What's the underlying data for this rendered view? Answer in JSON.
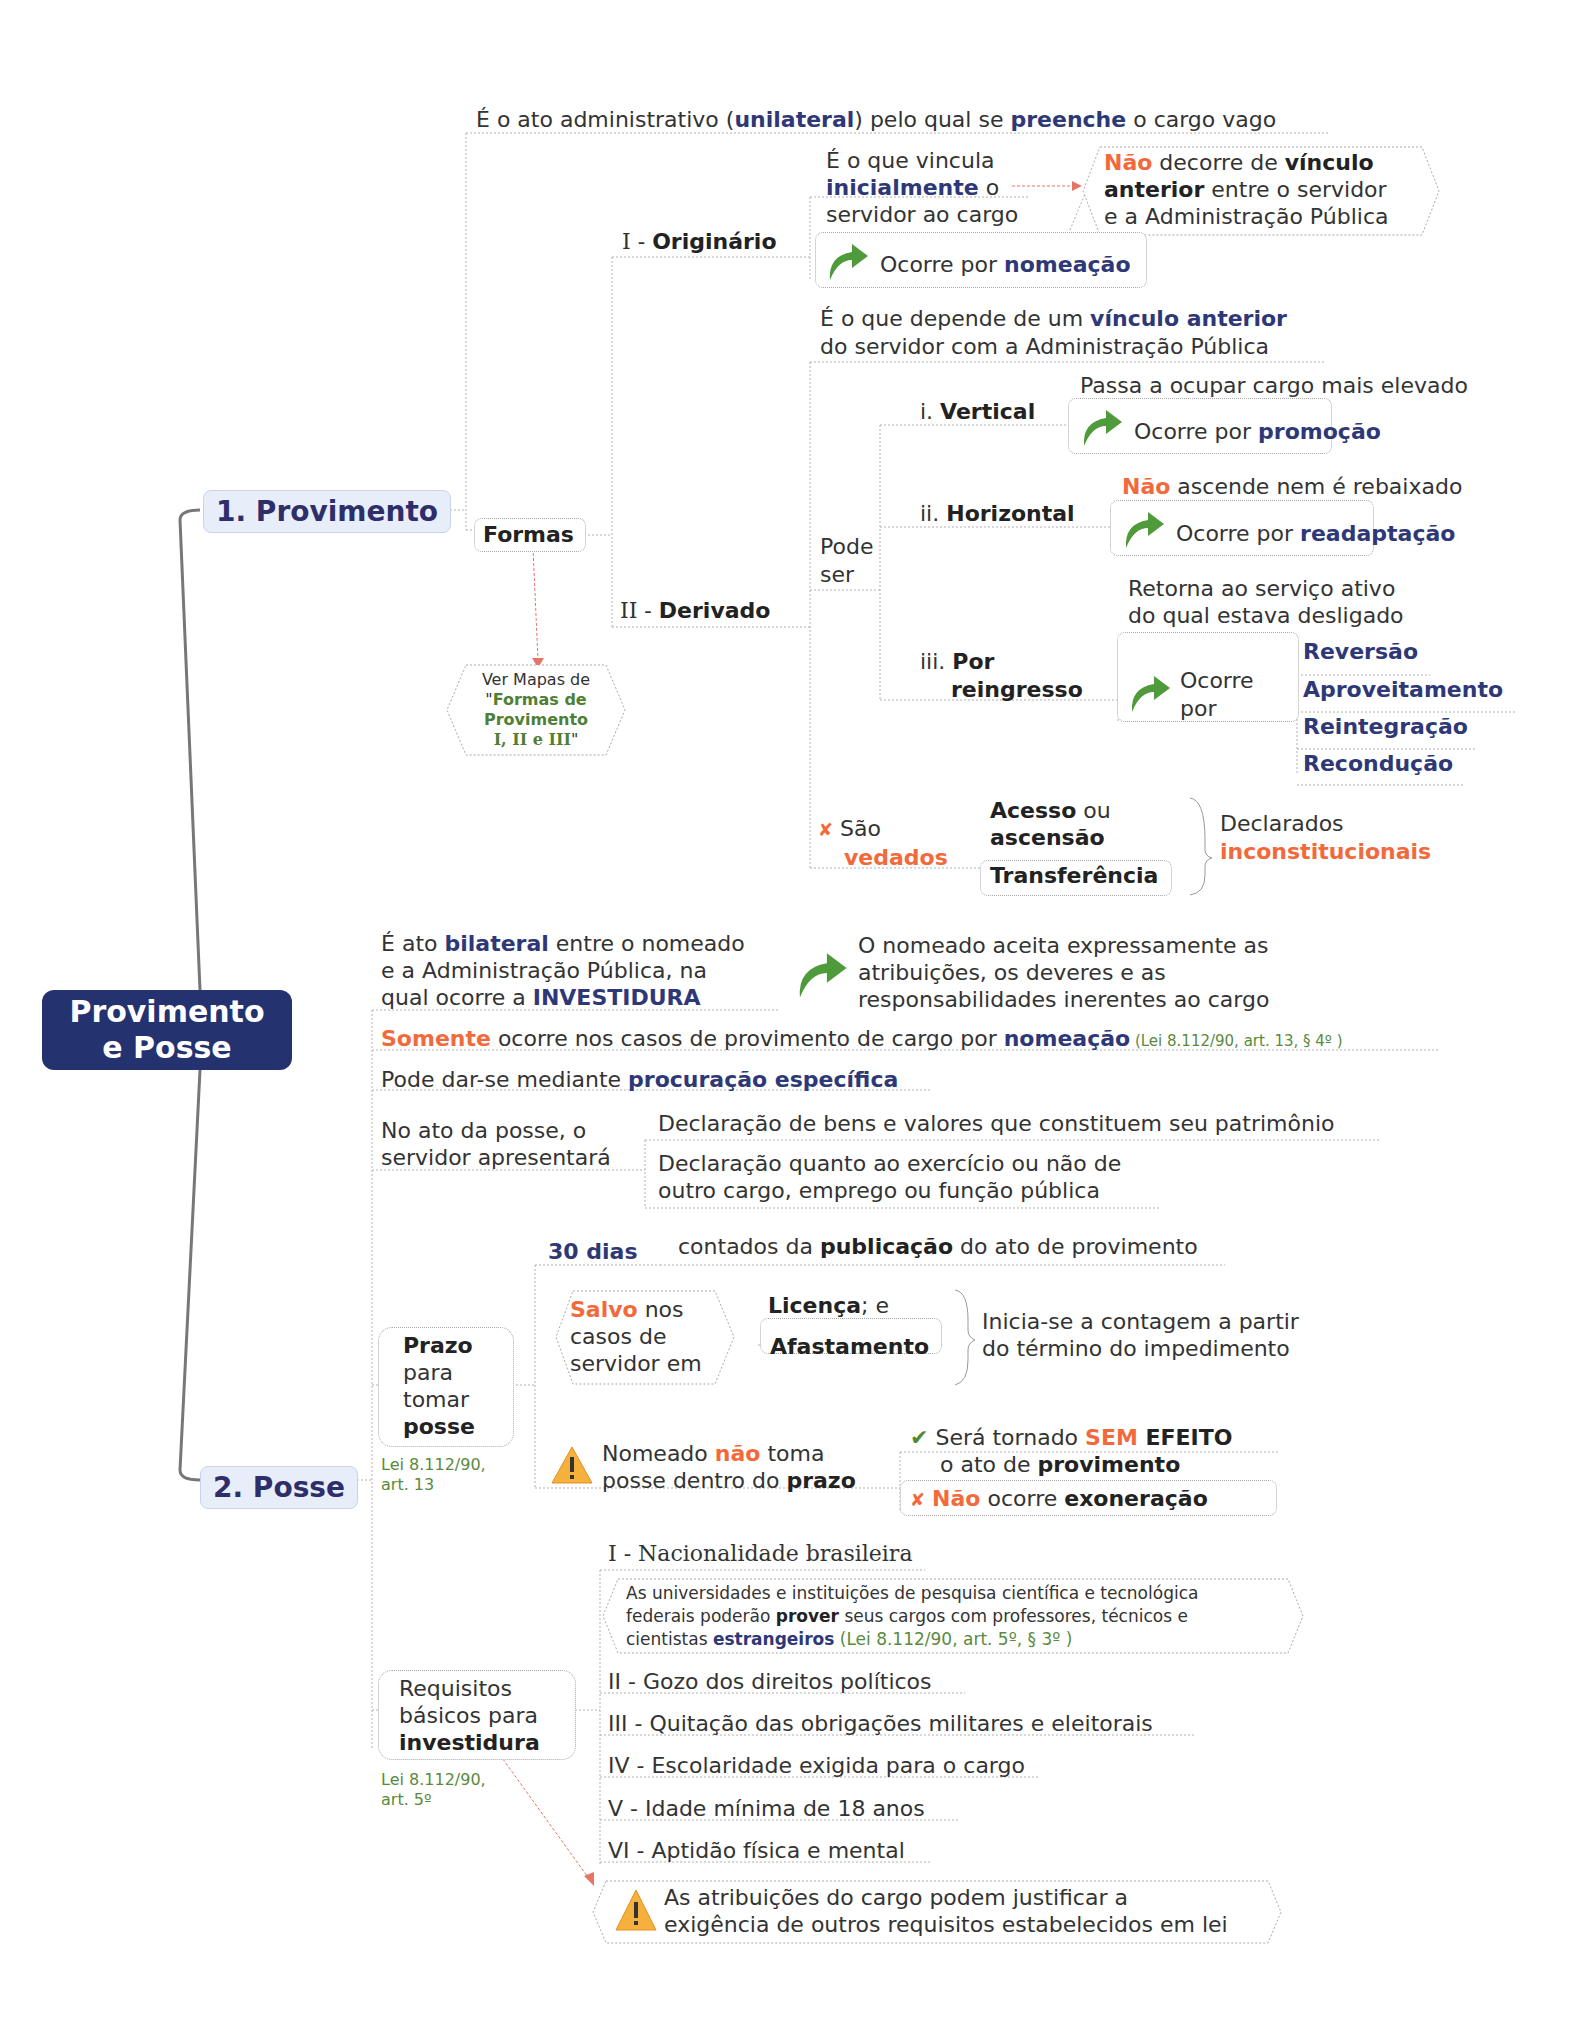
{
  "root": {
    "line1": "Provimento",
    "line2": "e Posse"
  },
  "colors": {
    "root_bg": "#253270",
    "accent_blue": "#2e3877",
    "accent_orange": "#f26a3c",
    "ref_green": "#5a8a3e",
    "main_node_bg": "#e8eef9"
  },
  "provimento": {
    "label": "1. Provimento",
    "definition": {
      "p1": "É o ato administrativo (",
      "k1": "unilateral",
      "p2": ") pelo qual se ",
      "k2": "preenche",
      "p3": " o cargo vago"
    },
    "formas_label": "Formas",
    "see_maps": {
      "l1": "Ver Mapas de",
      "q1": "\"",
      "l2": "Formas de",
      "l3": "Provimento",
      "l4": "I, II e III",
      "q2": "\""
    },
    "originario": {
      "prefix": "I - ",
      "label": "Originário",
      "desc": {
        "l1": "É o que vincula",
        "k1": "inicialmente",
        "l2": " o",
        "l3": "servidor ao cargo"
      },
      "note": {
        "k1": "Não",
        "p1": " decorre de ",
        "k2": "vínculo",
        "k3": "anterior",
        "p2": " entre o servidor",
        "l3": "e a Administração Pública"
      },
      "occurs": {
        "p": "Ocorre por ",
        "k": "nomeação"
      }
    },
    "derivado": {
      "prefix": "II - ",
      "label": "Derivado",
      "desc": {
        "p1": "É o que depende de um ",
        "k1": "vínculo anterior",
        "l2": "do servidor com a Administração Pública"
      },
      "pode_ser": {
        "l1": "Pode",
        "l2": "ser"
      },
      "vertical": {
        "prefix": "i. ",
        "label": "Vertical",
        "desc": "Passa a ocupar cargo mais elevado",
        "occurs_p": "Ocorre por ",
        "occurs_k": "promoção"
      },
      "horizontal": {
        "prefix": "ii. ",
        "label": "Horizontal",
        "desc_k": "Não",
        "desc_p": " ascende nem é rebaixado",
        "occurs_p": "Ocorre por ",
        "occurs_k": "readaptação"
      },
      "reingresso": {
        "prefix": "iii. ",
        "label1": "Por",
        "label2": "reingresso",
        "desc1": "Retorna ao serviço ativo",
        "desc2": "do qual estava desligado",
        "occurs1": "Ocorre",
        "occurs2": "por",
        "items": [
          "Reversão",
          "Aproveitamento",
          "Reintegração",
          "Recondução"
        ]
      },
      "vedados": {
        "icon": "✘",
        "l1": "São",
        "l2": "vedados",
        "item1_k": "Acesso",
        "item1_p": " ou",
        "item1_l2": "ascensão",
        "item2": "Transferência",
        "result1": "Declarados",
        "result2": "inconstitucionais"
      }
    }
  },
  "posse": {
    "label": "2. Posse",
    "bilateral": {
      "p1": "É ato ",
      "k1": "bilateral",
      "p2": " entre o nomeado",
      "l2": "e a Administração Pública, na",
      "l3p": "qual ocorre a ",
      "l3k": "INVESTIDURA"
    },
    "accepts": {
      "l1": "O nomeado aceita expressamente as",
      "l2": "atribuições, os deveres e as",
      "l3": "responsabilidades inerentes ao cargo"
    },
    "somente": {
      "k1": "Somente",
      "p1": " ocorre nos casos de provimento de cargo por ",
      "k2": "nomeação",
      "ref": " (Lei 8.112/90, art. 13, § 4º )"
    },
    "procuracao": {
      "p": "Pode dar-se mediante ",
      "k": "procuração específica"
    },
    "apresentara": {
      "l1": "No ato da posse, o",
      "l2": "servidor apresentará",
      "d1": "Declaração de bens e valores que constituem seu patrimônio",
      "d2a": "Declaração quanto ao exercício ou não de",
      "d2b": "outro cargo, emprego ou função pública"
    },
    "prazo": {
      "label1": "Prazo",
      "label2": "para",
      "label3": "tomar",
      "label4": "posse",
      "ref1": "Lei 8.112/90,",
      "ref2": "art. 13",
      "dias": "30 dias",
      "contados_p1": "contados da ",
      "contados_k": "publicação",
      "contados_p2": " do ato de provimento",
      "salvo": {
        "k": "Salvo",
        "p": " nos",
        "l2": "casos de",
        "l3": "servidor em"
      },
      "licenca_k": "Licença",
      "licenca_p": "; e",
      "afastamento": "Afastamento",
      "inicia1": "Inicia-se a contagem a partir",
      "inicia2": "do término do impedimento",
      "nao_toma": {
        "p1": "Nomeado ",
        "k1": "não",
        "p2": " toma",
        "l2p": "posse dentro do ",
        "l2k": "prazo"
      },
      "sem_efeito": {
        "icon": "✔",
        "p1": "Será tornado ",
        "k1": "SEM",
        "k2": " EFEITO",
        "l2p": "o ato de ",
        "l2k": "provimento"
      },
      "nao_exon": {
        "icon": "✘",
        "k1": "Não",
        "p1": " ocorre ",
        "k2": "exoneração"
      }
    },
    "requisitos": {
      "label1": "Requisitos",
      "label2": "básicos para",
      "label3": "investidura",
      "ref1": "Lei 8.112/90,",
      "ref2": "art. 5º",
      "items": [
        "I - Nacionalidade brasileira",
        "II - Gozo dos direitos políticos",
        "III - Quitação das obrigações militares e eleitorais",
        "IV - Escolaridade exigida para o cargo",
        "V - Idade mínima de 18 anos",
        "VI - Aptidão física e mental"
      ],
      "estrangeiros": {
        "l1": "As universidades e instituições de pesquisa científica e tecnológica",
        "l2p": "federais poderão  ",
        "l2k": "prover",
        "l2p2": " seus cargos com professores, técnicos e",
        "l3p": "cientistas  ",
        "l3k": "estrangeiros",
        "l3ref": " (Lei 8.112/90, art. 5º, § 3º )"
      },
      "warning": {
        "l1": "As atribuições do cargo podem justificar a",
        "l2": "exigência de outros requisitos estabelecidos em lei"
      }
    }
  }
}
